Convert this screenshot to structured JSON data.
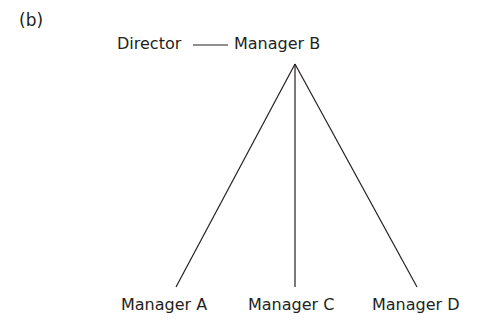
{
  "diagram": {
    "panel_label": "(b)",
    "type": "organizational-hierarchy",
    "nodes": [
      {
        "id": "director",
        "label": "Director"
      },
      {
        "id": "manager_b",
        "label": "Manager B"
      },
      {
        "id": "manager_a",
        "label": "Manager A"
      },
      {
        "id": "manager_c",
        "label": "Manager C"
      },
      {
        "id": "manager_d",
        "label": "Manager D"
      }
    ],
    "edges": [
      {
        "from": "director",
        "to": "manager_b",
        "style": "horizontal"
      },
      {
        "from": "manager_b",
        "to": "manager_a"
      },
      {
        "from": "manager_b",
        "to": "manager_c"
      },
      {
        "from": "manager_b",
        "to": "manager_d"
      }
    ]
  }
}
